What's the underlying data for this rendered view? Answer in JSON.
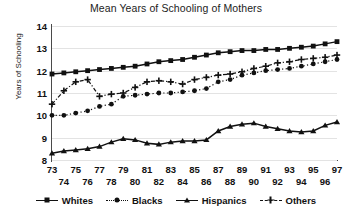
{
  "chart_data": {
    "type": "line",
    "title": "Mean Years of Schooling of Mothers",
    "xlabel": "",
    "ylabel": "Years of Schooling",
    "ylim": [
      8,
      14
    ],
    "yticks": [
      8,
      9,
      10,
      11,
      12,
      13,
      14
    ],
    "grid": true,
    "legend_position": "bottom",
    "x": [
      73,
      74,
      75,
      76,
      77,
      78,
      79,
      80,
      81,
      82,
      83,
      84,
      85,
      86,
      87,
      88,
      89,
      90,
      91,
      92,
      93,
      94,
      95,
      96,
      97
    ],
    "xticks_top": [
      73,
      75,
      77,
      79,
      81,
      83,
      85,
      87,
      89,
      91,
      93,
      95,
      97
    ],
    "xticks_bottom": [
      74,
      76,
      78,
      80,
      82,
      84,
      86,
      88,
      90,
      92,
      94,
      96
    ],
    "series": [
      {
        "name": "Whites",
        "marker": "square",
        "line_style": "solid",
        "values": [
          11.85,
          11.9,
          11.95,
          12.0,
          12.05,
          12.1,
          12.15,
          12.2,
          12.3,
          12.4,
          12.45,
          12.5,
          12.6,
          12.7,
          12.8,
          12.85,
          12.9,
          12.9,
          12.95,
          12.95,
          13.0,
          13.05,
          13.1,
          13.2,
          13.3
        ]
      },
      {
        "name": "Blacks",
        "marker": "circle",
        "line_style": "dotted",
        "values": [
          10.0,
          10.0,
          10.1,
          10.2,
          10.4,
          10.5,
          10.85,
          10.9,
          10.95,
          11.0,
          11.0,
          11.05,
          11.1,
          11.2,
          11.5,
          11.6,
          11.8,
          11.9,
          12.0,
          12.05,
          12.1,
          12.2,
          12.3,
          12.4,
          12.5
        ]
      },
      {
        "name": "Hispanics",
        "marker": "triangle",
        "line_style": "solid",
        "values": [
          8.3,
          8.4,
          8.45,
          8.5,
          8.6,
          8.8,
          8.95,
          8.9,
          8.75,
          8.7,
          8.8,
          8.85,
          8.85,
          8.9,
          9.3,
          9.5,
          9.6,
          9.65,
          9.5,
          9.4,
          9.3,
          9.25,
          9.3,
          9.55,
          9.7
        ]
      },
      {
        "name": "Others",
        "marker": "plus",
        "line_style": "dashdot",
        "values": [
          10.5,
          11.1,
          11.5,
          11.6,
          10.85,
          10.95,
          11.0,
          11.25,
          11.5,
          11.55,
          11.5,
          11.4,
          11.6,
          11.7,
          11.8,
          11.85,
          11.95,
          12.1,
          12.2,
          12.35,
          12.4,
          12.5,
          12.55,
          12.6,
          12.7
        ]
      }
    ]
  },
  "colors": {
    "ink": "#111111",
    "grid": "#e3e3e3",
    "axis": "#4a4a4a",
    "background": "#ffffff"
  }
}
